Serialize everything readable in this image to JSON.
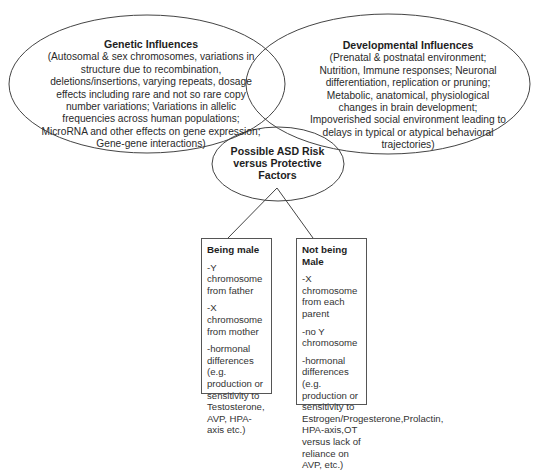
{
  "diagram": {
    "type": "venn-with-tree",
    "colors": {
      "stroke": "#444444",
      "text": "#222222",
      "background": "#ffffff"
    },
    "genetic": {
      "title": "Genetic Influences",
      "body": "(Autosomal & sex chromosomes, variations in structure due to recombination, deletions/insertions, varying repeats, dosage effects including rare and not so rare copy number variations; Variations in allelic frequencies across human populations; MicroRNA and other effects on gene expression; Gene-gene interactions)"
    },
    "developmental": {
      "title": "Developmental Influences",
      "body": "(Prenatal & postnatal environment; Nutrition, Immune responses; Neuronal differentiation, replication or pruning; Metabolic, anatomical, physiological changes in brain development; Impoverished social environment leading to delays in typical or atypical behavioral trajectories)"
    },
    "center": {
      "title": "Possible ASD Risk versus Protective Factors"
    },
    "branches": [
      {
        "title": "Being male",
        "items": [
          "-Y chromosome from father",
          "-X chromosome from mother",
          "-hormonal differences (e.g. production or sensitivity to Testosterone, AVP, HPA-axis etc.)"
        ]
      },
      {
        "title": "Not being Male",
        "items": [
          "-X chromosome from each parent",
          "-no Y chromosome",
          "-hormonal differences (e.g. production or sensitivity to Estrogen/Progesterone,Prolactin, HPA-axis,OT versus lack of reliance on AVP, etc.)"
        ]
      }
    ]
  }
}
